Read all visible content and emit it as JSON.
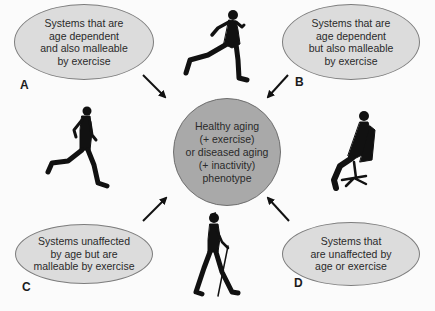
{
  "diagram": {
    "center": {
      "text": "Healthy aging\n(+ exercise)\nor diseased aging\n(+ inactivity)\nphenotype",
      "fill": "#a9a9a9"
    },
    "quadrants": [
      {
        "letter": "A",
        "text": "Systems that are\nage dependent\nand also malleable\nby exercise",
        "position": "top-left"
      },
      {
        "letter": "B",
        "text": "Systems that are\nage dependent\nbut also malleable\nby exercise",
        "position": "top-right"
      },
      {
        "letter": "C",
        "text": "Systems unaffected\nby age but are\nmalleable by exercise",
        "position": "bottom-left"
      },
      {
        "letter": "D",
        "text": "Systems that\nare unaffected by\nage or exercise",
        "position": "bottom-right"
      }
    ],
    "figures": [
      {
        "name": "runner-top",
        "icon": "running-man-icon"
      },
      {
        "name": "runner-left",
        "icon": "running-man-icon"
      },
      {
        "name": "sitting-person",
        "icon": "office-chair-sitting-icon"
      },
      {
        "name": "nordic-walker",
        "icon": "walking-pole-woman-icon"
      }
    ],
    "colors": {
      "ellipse_fill": "#dcdcdc",
      "center_fill": "#a9a9a9",
      "arrow": "#111111",
      "silhouette": "#111111"
    }
  }
}
